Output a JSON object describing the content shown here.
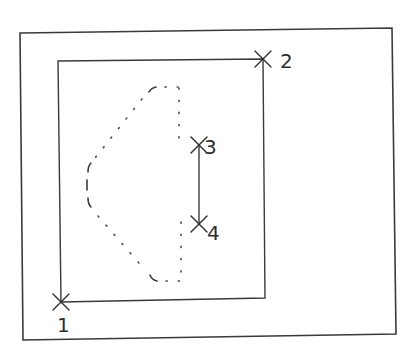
{
  "diagram": {
    "outer_frame": {
      "x1": 20,
      "y1": 33,
      "x2": 392,
      "y2": 28,
      "x3": 396,
      "y3": 334,
      "x4": 23,
      "y4": 340
    },
    "inner_rect": {
      "x1": 58,
      "y1": 61,
      "x2": 263,
      "y2": 59,
      "x3": 265,
      "y3": 298,
      "x4": 61,
      "y4": 302
    },
    "points": [
      {
        "id": "1",
        "label": "1",
        "x": 61,
        "y": 302,
        "label_x": 57,
        "label_y": 332
      },
      {
        "id": "2",
        "label": "2",
        "x": 263,
        "y": 59,
        "label_x": 280,
        "label_y": 68
      },
      {
        "id": "3",
        "label": "3",
        "x": 199,
        "y": 145,
        "label_x": 204,
        "label_y": 154
      },
      {
        "id": "4",
        "label": "4",
        "x": 199,
        "y": 224,
        "label_x": 207,
        "label_y": 240
      }
    ],
    "segment_3_4": {
      "from": "3",
      "to": "4"
    },
    "dotted_shape": {
      "description": "dotted D-shaped outline (hidden/removed region) with a break on its right edge between points 3 and 4",
      "color": "#4a4a4a"
    },
    "line_color": "#3a3a3a",
    "background": "#ffffff"
  }
}
